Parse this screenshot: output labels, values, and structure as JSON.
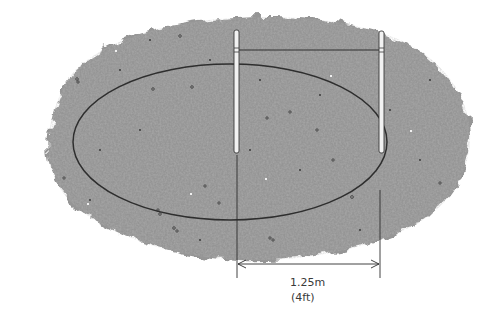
{
  "diagram": {
    "elements": {
      "ground_area": "textured gravel / soil patch",
      "oval_outline": "elliptical outline",
      "stakes": [
        "left-stake",
        "right-stake"
      ],
      "string_line": "string tied between stakes",
      "dimension": {
        "metric": "1.25m",
        "imperial": "(4ft)"
      }
    },
    "colors": {
      "ground": "#8f8f8f",
      "ground_light": "#b4b4b4",
      "outline": "#2e2e2e",
      "stake_fill": "#f2f2f2",
      "text": "#3a3a3a"
    }
  }
}
